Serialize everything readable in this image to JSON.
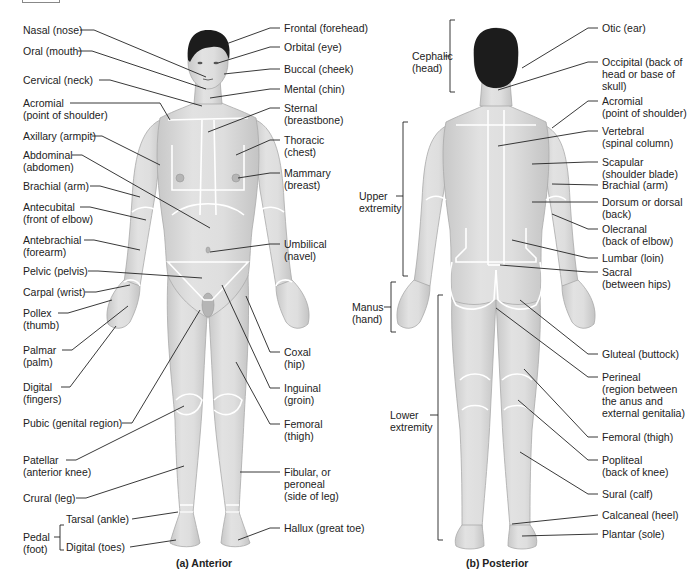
{
  "figure": {
    "anterior": {
      "caption": "(a)  Anterior",
      "left_labels": [
        {
          "id": "nasal",
          "text": "Nasal (nose)"
        },
        {
          "id": "oral",
          "text": "Oral (mouth)"
        },
        {
          "id": "cervical",
          "text": "Cervical (neck)"
        },
        {
          "id": "acromial",
          "line1": "Acromial",
          "line2": "(point of shoulder)"
        },
        {
          "id": "axillary",
          "text": "Axillary (armpit)"
        },
        {
          "id": "abdominal",
          "line1": "Abdominal",
          "line2": "(abdomen)"
        },
        {
          "id": "brachial",
          "text": "Brachial (arm)"
        },
        {
          "id": "antecubital",
          "line1": "Antecubital",
          "line2": "(front of elbow)"
        },
        {
          "id": "antebrachial",
          "line1": "Antebrachial",
          "line2": "(forearm)"
        },
        {
          "id": "pelvic",
          "text": "Pelvic (pelvis)"
        },
        {
          "id": "carpal",
          "text": "Carpal (wrist)"
        },
        {
          "id": "pollex",
          "line1": "Pollex",
          "line2": "(thumb)"
        },
        {
          "id": "palmar",
          "line1": "Palmar",
          "line2": "(palm)"
        },
        {
          "id": "digital",
          "line1": "Digital",
          "line2": "(fingers)"
        },
        {
          "id": "pubic",
          "text": "Pubic (genital region)"
        },
        {
          "id": "patellar",
          "line1": "Patellar",
          "line2": "(anterior knee)"
        },
        {
          "id": "crural",
          "text": "Crural (leg)"
        },
        {
          "id": "pedal",
          "line1": "Pedal",
          "line2": "(foot)"
        },
        {
          "id": "tarsal",
          "text": "Tarsal (ankle)"
        },
        {
          "id": "digital_toes",
          "text": "Digital (toes)"
        }
      ],
      "right_labels": [
        {
          "id": "frontal",
          "text": "Frontal (forehead)"
        },
        {
          "id": "orbital",
          "text": "Orbital (eye)"
        },
        {
          "id": "buccal",
          "text": "Buccal (cheek)"
        },
        {
          "id": "mental",
          "text": "Mental (chin)"
        },
        {
          "id": "sternal",
          "line1": "Sternal",
          "line2": "(breastbone)"
        },
        {
          "id": "thoracic",
          "line1": "Thoracic",
          "line2": "(chest)"
        },
        {
          "id": "mammary",
          "line1": "Mammary",
          "line2": "(breast)"
        },
        {
          "id": "umbilical",
          "line1": "Umbilical",
          "line2": "(navel)"
        },
        {
          "id": "coxal",
          "line1": "Coxal",
          "line2": "(hip)"
        },
        {
          "id": "inguinal",
          "line1": "Inguinal",
          "line2": "(groin)"
        },
        {
          "id": "femoral",
          "line1": "Femoral",
          "line2": "(thigh)"
        },
        {
          "id": "fibular",
          "line1": "Fibular, or",
          "line2": "peroneal",
          "line3": "(side of leg)"
        },
        {
          "id": "hallux",
          "text": "Hallux (great toe)"
        }
      ]
    },
    "posterior": {
      "caption": "(b)  Posterior",
      "left_labels": [
        {
          "id": "cephalic",
          "line1": "Cephalic",
          "line2": "(head)"
        },
        {
          "id": "upper_extremity",
          "line1": "Upper",
          "line2": "extremity"
        },
        {
          "id": "manus",
          "line1": "Manus",
          "line2": "(hand)"
        },
        {
          "id": "lower_extremity",
          "line1": "Lower",
          "line2": "extremity"
        }
      ],
      "right_labels": [
        {
          "id": "otic",
          "text": "Otic (ear)"
        },
        {
          "id": "occipital",
          "line1": "Occipital (back of",
          "line2": "head or base of",
          "line3": "skull)"
        },
        {
          "id": "acromial",
          "line1": "Acromial",
          "line2": "(point of shoulder)"
        },
        {
          "id": "vertebral",
          "line1": "Vertebral",
          "line2": "(spinal column)"
        },
        {
          "id": "scapular",
          "line1": "Scapular",
          "line2": "(shoulder blade)"
        },
        {
          "id": "brachial",
          "text": "Brachial (arm)"
        },
        {
          "id": "dorsum",
          "line1": "Dorsum or dorsal",
          "line2": "(back)"
        },
        {
          "id": "olecranal",
          "line1": "Olecranal",
          "line2": "(back of elbow)"
        },
        {
          "id": "lumbar",
          "text": "Lumbar (loin)"
        },
        {
          "id": "sacral",
          "line1": "Sacral",
          "line2": "(between hips)"
        },
        {
          "id": "gluteal",
          "text": "Gluteal (buttock)"
        },
        {
          "id": "perineal",
          "line1": "Perineal",
          "line2": "(region between",
          "line3": "the anus and",
          "line4": "external genitalia)"
        },
        {
          "id": "femoral",
          "text": "Femoral (thigh)"
        },
        {
          "id": "popliteal",
          "line1": "Popliteal",
          "line2": "(back of knee)"
        },
        {
          "id": "sural",
          "text": "Sural (calf)"
        },
        {
          "id": "calcaneal",
          "text": "Calcaneal (heel)"
        },
        {
          "id": "plantar",
          "text": "Plantar (sole)"
        }
      ]
    }
  },
  "colors": {
    "skin": "#d9d9d9",
    "skin_shade": "#bdbdbd",
    "hair": "#1c1c1c",
    "region_line": "#ffffff",
    "leader": "#222222"
  }
}
